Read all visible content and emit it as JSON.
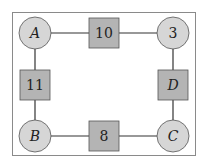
{
  "diagram": {
    "frame": {
      "x": 12,
      "y": 12,
      "w": 183,
      "h": 143,
      "stroke": "#8a8a8a"
    },
    "colors": {
      "circle_fill": "#d6d6d6",
      "square_fill": "#b4b4b4",
      "stroke": "#555555",
      "edge": "#333333"
    },
    "nodes": [
      {
        "id": "A",
        "label": "A",
        "shape": "circle",
        "italic": true,
        "cx": 35,
        "cy": 33
      },
      {
        "id": "n10",
        "label": "10",
        "shape": "square",
        "italic": false,
        "cx": 104,
        "cy": 33
      },
      {
        "id": "n3",
        "label": "3",
        "shape": "circle",
        "italic": false,
        "cx": 173,
        "cy": 33
      },
      {
        "id": "n11",
        "label": "11",
        "shape": "square",
        "italic": false,
        "cx": 35,
        "cy": 85
      },
      {
        "id": "D",
        "label": "D",
        "shape": "square",
        "italic": true,
        "cx": 173,
        "cy": 85
      },
      {
        "id": "B",
        "label": "B",
        "shape": "circle",
        "italic": true,
        "cx": 35,
        "cy": 136
      },
      {
        "id": "n8",
        "label": "8",
        "shape": "square",
        "italic": false,
        "cx": 104,
        "cy": 136
      },
      {
        "id": "C",
        "label": "C",
        "shape": "circle",
        "italic": true,
        "cx": 173,
        "cy": 136
      }
    ],
    "edges": [
      [
        "A",
        "n10"
      ],
      [
        "n10",
        "n3"
      ],
      [
        "A",
        "n11"
      ],
      [
        "n11",
        "B"
      ],
      [
        "n3",
        "D"
      ],
      [
        "D",
        "C"
      ],
      [
        "B",
        "n8"
      ],
      [
        "n8",
        "C"
      ]
    ]
  }
}
